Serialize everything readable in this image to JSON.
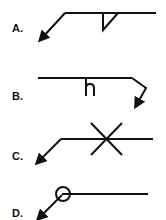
{
  "options": [
    {
      "label": "A.",
      "symbol": "fillet-weld-arrow-side"
    },
    {
      "label": "B.",
      "symbol": "j-groove-weld-arrow-side"
    },
    {
      "label": "C.",
      "symbol": "cross-symbol-both-sides"
    },
    {
      "label": "D.",
      "symbol": "weld-all-around-circle"
    }
  ],
  "colors": {
    "stroke": "#111111",
    "background": "#ffffff"
  }
}
